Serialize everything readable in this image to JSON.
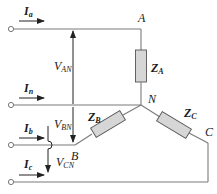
{
  "diagram": {
    "type": "three-phase wye-connected load with neutral",
    "nodes": {
      "A": "A",
      "N": "N",
      "B": "B",
      "C": "C"
    },
    "currents": [
      {
        "symbol": "I",
        "sub": "a"
      },
      {
        "symbol": "I",
        "sub": "n"
      },
      {
        "symbol": "I",
        "sub": "b"
      },
      {
        "symbol": "I",
        "sub": "c"
      }
    ],
    "voltages": [
      {
        "symbol": "V",
        "sub": "AN"
      },
      {
        "symbol": "V",
        "sub": "BN"
      },
      {
        "symbol": "V",
        "sub": "CN"
      }
    ],
    "impedances": [
      {
        "symbol": "Z",
        "sub": "A"
      },
      {
        "symbol": "Z",
        "sub": "B"
      },
      {
        "symbol": "Z",
        "sub": "C"
      }
    ],
    "colors": {
      "wire": "#7a7a7a",
      "resistor_fill": "#d6d6d6",
      "text": "#1a1a1a"
    }
  }
}
